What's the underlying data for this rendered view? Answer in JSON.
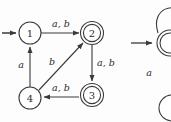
{
  "figure": {
    "kind": "finite-state-automaton-diagram",
    "background_color": "#fdfdfd",
    "line_color": "#3a3a3a",
    "text_color": "#2b2b2b"
  },
  "automaton_left": {
    "states": [
      {
        "id": "1",
        "label": "1",
        "x": 30,
        "y": 33,
        "radius": 11,
        "accepting": false,
        "start": true
      },
      {
        "id": "2",
        "label": "2",
        "x": 92,
        "y": 33,
        "radius": 11,
        "accepting": true,
        "start": false
      },
      {
        "id": "3",
        "label": "3",
        "x": 92,
        "y": 95,
        "radius": 11,
        "accepting": true,
        "start": false
      },
      {
        "id": "4",
        "label": "4",
        "x": 30,
        "y": 98,
        "radius": 11,
        "accepting": false,
        "start": false
      }
    ],
    "start_arrow": {
      "from_x": 2,
      "from_y": 33,
      "to_x": 17,
      "to_y": 33
    },
    "transitions": [
      {
        "from": "1",
        "to": "2",
        "label": "a, b",
        "label_x": 61,
        "label_y": 23
      },
      {
        "from": "2",
        "to": "3",
        "label": "a, b",
        "label_x": 105,
        "label_y": 62
      },
      {
        "from": "3",
        "to": "4",
        "label": "a, b",
        "label_x": 61,
        "label_y": 87
      },
      {
        "from": "4",
        "to": "1",
        "label": "a",
        "label_x": 21,
        "label_y": 64
      },
      {
        "from": "4",
        "to": "2",
        "label": "b",
        "label_x": 52,
        "label_y": 61
      }
    ]
  },
  "automaton_right_partial": {
    "note_visible": "cropped second diagram at right edge",
    "self_loop_label": "",
    "edge_label_a": "a",
    "edge_label_a_x": 149,
    "edge_label_a_y": 72,
    "start_arrow": {
      "from_x": 131,
      "from_y": 43,
      "to_x": 151,
      "to_y": 43
    },
    "states": [
      {
        "id": "r1",
        "x": 168,
        "y": 43,
        "radius": 13,
        "accepting": true
      },
      {
        "id": "r2",
        "x": 168,
        "y": 108,
        "radius": 13,
        "accepting": false
      }
    ]
  }
}
